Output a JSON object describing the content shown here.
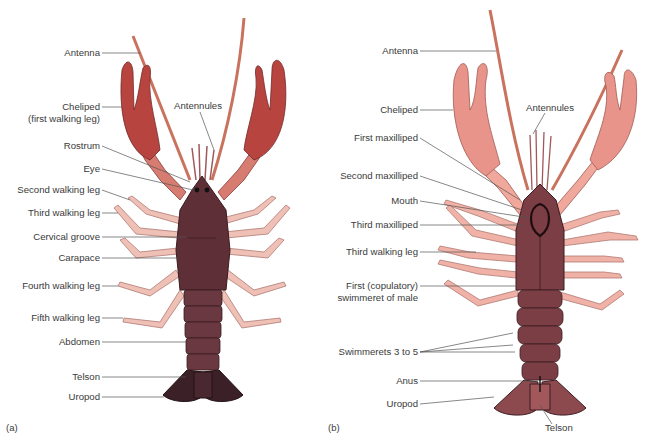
{
  "figure": {
    "panels": [
      {
        "tag": "(a)",
        "view": "dorsal",
        "colors": {
          "claw": "#b8443f",
          "body": "#5e2f36",
          "legs": "#e6a49a",
          "tail": "#3b2027",
          "antenna": "#c9735f"
        },
        "labels": [
          {
            "id": "antenna",
            "text": "Antenna"
          },
          {
            "id": "cheliped",
            "text": "Cheliped",
            "text2": "(first walking leg)"
          },
          {
            "id": "antennules",
            "text": "Antennules"
          },
          {
            "id": "rostrum",
            "text": "Rostrum"
          },
          {
            "id": "eye",
            "text": "Eye"
          },
          {
            "id": "second-walking-leg",
            "text": "Second walking leg"
          },
          {
            "id": "third-walking-leg",
            "text": "Third walking leg"
          },
          {
            "id": "cervical-groove",
            "text": "Cervical groove"
          },
          {
            "id": "carapace",
            "text": "Carapace"
          },
          {
            "id": "fourth-walking-leg",
            "text": "Fourth walking leg"
          },
          {
            "id": "fifth-walking-leg",
            "text": "Fifth walking leg"
          },
          {
            "id": "abdomen",
            "text": "Abdomen"
          },
          {
            "id": "telson",
            "text": "Telson"
          },
          {
            "id": "uropod",
            "text": "Uropod"
          }
        ]
      },
      {
        "tag": "(b)",
        "view": "ventral",
        "colors": {
          "claw": "#e9948a",
          "body": "#7a3e44",
          "legs": "#f0b2a6",
          "tail": "#8c4a4f",
          "antenna": "#c9735f"
        },
        "labels": [
          {
            "id": "antenna",
            "text": "Antenna"
          },
          {
            "id": "cheliped",
            "text": "Cheliped"
          },
          {
            "id": "antennules",
            "text": "Antennules"
          },
          {
            "id": "first-maxilliped",
            "text": "First maxilliped"
          },
          {
            "id": "second-maxilliped",
            "text": "Second maxilliped"
          },
          {
            "id": "mouth",
            "text": "Mouth"
          },
          {
            "id": "third-maxilliped",
            "text": "Third maxilliped"
          },
          {
            "id": "third-walking-leg",
            "text": "Third walking leg"
          },
          {
            "id": "first-swimmeret",
            "text": "First (copulatory)",
            "text2": "swimmeret of male"
          },
          {
            "id": "swimmerets",
            "text": "Swimmerets 3 to 5"
          },
          {
            "id": "anus",
            "text": "Anus"
          },
          {
            "id": "uropod",
            "text": "Uropod"
          },
          {
            "id": "telson",
            "text": "Telson"
          }
        ]
      }
    ]
  }
}
